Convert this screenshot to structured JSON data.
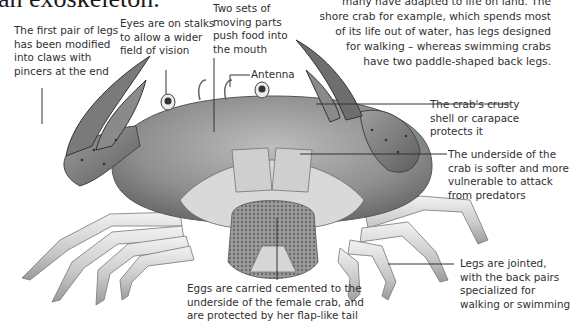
{
  "page": {
    "heading_fragment": "an exoskeleton.",
    "intro_paragraph": "many have adapted to life on land. The shore crab for example, which spends most of its life out of water, has legs designed for walking – whereas swimming crabs have two paddle-shaped back legs.",
    "intro_lines": [
      "many have adapted to life on land. The",
      "shore crab for example, which spends most",
      "of its life out of water, has legs designed",
      "for walking – whereas swimming crabs",
      "have two paddle-shaped back legs."
    ]
  },
  "illustration": {
    "subject": "crab (underside view, female carrying eggs)",
    "colors": {
      "ink": "#2f2f2f",
      "shell": "#9a9a9a",
      "leg": "#cfcfcf",
      "eggs": "#8a8a8a",
      "spots": "#3a3a3a"
    }
  },
  "annotations": {
    "claws": {
      "lines": [
        "The first pair of legs",
        "has been modified",
        "into claws with",
        "pincers at the end"
      ]
    },
    "eyes": {
      "lines": [
        "Eyes are on stalks",
        "to allow a wider",
        "field of vision"
      ]
    },
    "mouthparts": {
      "lines": [
        "Two sets of",
        "moving parts",
        "push food into",
        "the mouth"
      ]
    },
    "antenna": {
      "lines": [
        "Antenna"
      ]
    },
    "carapace": {
      "lines": [
        "The crab's crusty",
        "shell or carapace",
        "protects it"
      ]
    },
    "underside": {
      "lines": [
        "The underside of the",
        "crab is softer and more",
        "vulnerable to attack",
        "from predators"
      ]
    },
    "legs": {
      "lines": [
        "Legs are jointed,",
        "with the back pairs",
        "specialized for",
        "walking or swimming"
      ]
    },
    "eggs": {
      "lines": [
        "Eggs are carried cemented to the",
        "underside of the female crab, and",
        "are protected by her flap-like tail"
      ]
    }
  }
}
